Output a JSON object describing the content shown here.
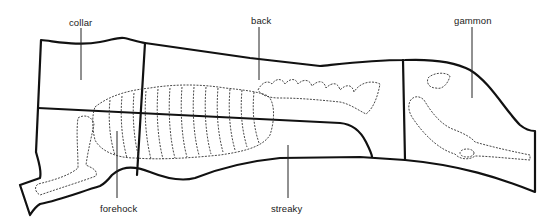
{
  "diagram": {
    "labels": [
      {
        "id": "collar",
        "text": "collar",
        "x": 69,
        "y": 17
      },
      {
        "id": "back",
        "text": "back",
        "x": 251,
        "y": 15
      },
      {
        "id": "gammon",
        "text": "gammon",
        "x": 454,
        "y": 15
      },
      {
        "id": "forehock",
        "text": "forehock",
        "x": 100,
        "y": 203
      },
      {
        "id": "streaky",
        "text": "streaky",
        "x": 271,
        "y": 203
      }
    ],
    "colors": {
      "outline": "#111111",
      "text": "#1a1a1a",
      "background": "#ffffff"
    }
  }
}
